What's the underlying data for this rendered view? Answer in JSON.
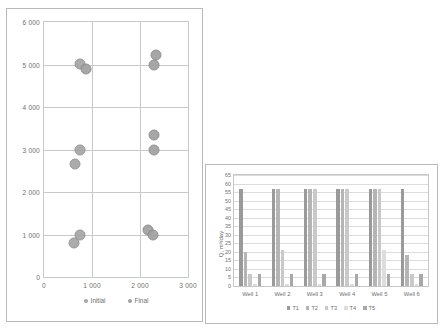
{
  "chart_data": [
    {
      "id": "scatter",
      "type": "scatter",
      "title": "",
      "xlabel": "",
      "ylabel": "",
      "xlim": [
        0,
        3000
      ],
      "ylim": [
        0,
        6000
      ],
      "xticks": [
        "0",
        "1 000",
        "2 000",
        "3 000"
      ],
      "xtick_values": [
        0,
        1000,
        2000,
        3000
      ],
      "yticks": [
        "0",
        "1 000",
        "2 000",
        "3 000",
        "4 000",
        "5 000",
        "6 000"
      ],
      "ytick_values": [
        0,
        1000,
        2000,
        3000,
        4000,
        5000,
        6000
      ],
      "grid": true,
      "legend_position": "bottom",
      "series": [
        {
          "name": "Initial",
          "color": "#a6a6a6",
          "points": [
            {
              "x": 760,
              "y": 5020
            },
            {
              "x": 760,
              "y": 3000
            },
            {
              "x": 650,
              "y": 2660
            },
            {
              "x": 760,
              "y": 1000
            },
            {
              "x": 620,
              "y": 790
            }
          ]
        },
        {
          "name": "Final",
          "color": "#a0a0a0",
          "points": [
            {
              "x": 870,
              "y": 4900
            },
            {
              "x": 2340,
              "y": 5230
            },
            {
              "x": 2290,
              "y": 5000
            },
            {
              "x": 2290,
              "y": 3350
            },
            {
              "x": 2300,
              "y": 3000
            },
            {
              "x": 2170,
              "y": 1100
            },
            {
              "x": 2280,
              "y": 1000
            }
          ]
        }
      ]
    },
    {
      "id": "bars",
      "type": "bar",
      "title": "",
      "xlabel": "",
      "ylabel": "Q, m³/day",
      "ylim": [
        0,
        65
      ],
      "categories": [
        "Well 1",
        "Well 2",
        "Well 3",
        "Well 4",
        "Well 5",
        "Well 6"
      ],
      "yticks": [
        "0",
        "5",
        "10",
        "15",
        "20",
        "25",
        "30",
        "35",
        "40",
        "45",
        "50",
        "55",
        "60",
        "65"
      ],
      "ytick_values": [
        0,
        5,
        10,
        15,
        20,
        25,
        30,
        35,
        40,
        45,
        50,
        55,
        60,
        65
      ],
      "grid": true,
      "legend_position": "bottom",
      "series": [
        {
          "name": "T1",
          "color": "#9a9a9a",
          "values": [
            57,
            57,
            57,
            57,
            57,
            57
          ]
        },
        {
          "name": "T2",
          "color": "#b5b5b5",
          "values": [
            20,
            57,
            57,
            57,
            57,
            18
          ]
        },
        {
          "name": "T3",
          "color": "#c9c9c9",
          "values": [
            7,
            21,
            57,
            57,
            57,
            7
          ]
        },
        {
          "name": "T4",
          "color": "#dddddd",
          "values": [
            1,
            1,
            1,
            1,
            21,
            1
          ]
        },
        {
          "name": "T5",
          "color": "#a8a8a8",
          "values": [
            7,
            7,
            7,
            7,
            7,
            7
          ]
        }
      ]
    }
  ]
}
